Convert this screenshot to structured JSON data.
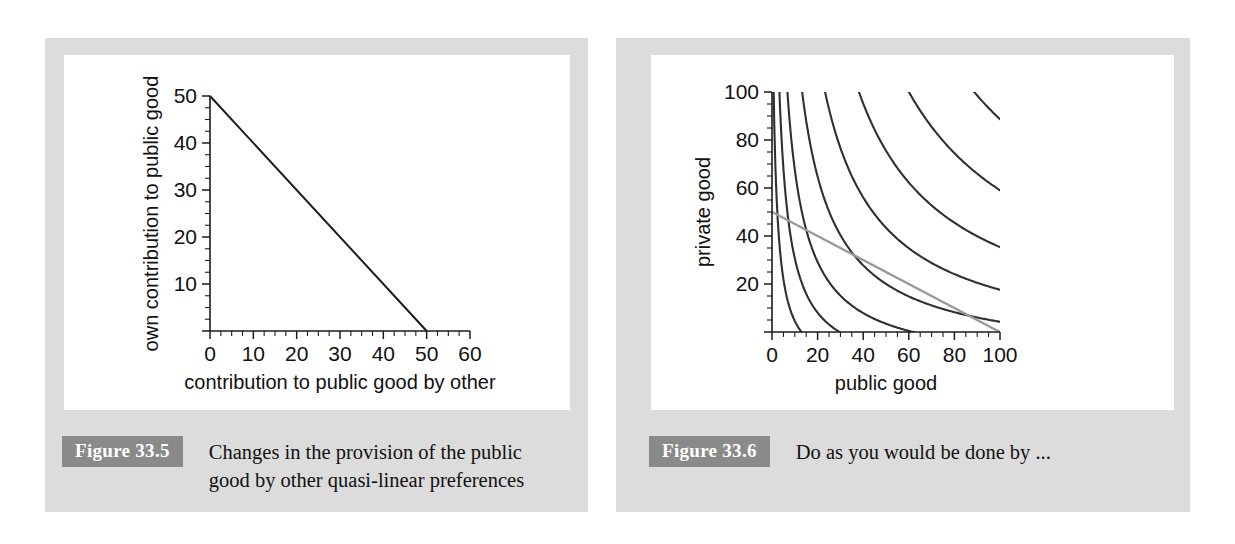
{
  "page": {
    "background_color": "#ffffff",
    "panel_color": "#dcdcdc",
    "plot_background": "#ffffff",
    "badge_color": "#8a8a8a",
    "curve_color": "#2e3035",
    "budget_gray": "#9a9a9a"
  },
  "figures": [
    {
      "badge": "Figure 33.5",
      "caption_line1": "Changes in the provision of the public",
      "caption_line2": "good by other quasi-linear preferences"
    },
    {
      "badge": "Figure 33.6",
      "caption_line1": "Do as you would be done by ...",
      "caption_line2": ""
    }
  ],
  "chart_data": [
    {
      "type": "line",
      "title": "",
      "xlabel": "contribution to public good by other",
      "ylabel": "own contribution to public good",
      "xlim": [
        0,
        60
      ],
      "ylim": [
        0,
        50
      ],
      "xticks": [
        0,
        10,
        20,
        30,
        40,
        50,
        60
      ],
      "xtick_labels": [
        "0",
        "10",
        "20",
        "30",
        "40",
        "50",
        "60"
      ],
      "yticks": [
        0,
        10,
        20,
        30,
        40,
        50
      ],
      "ytick_labels": [
        "",
        "10",
        "20",
        "30",
        "40",
        "50"
      ],
      "minor_tick_step_x": 2.5,
      "minor_tick_step_y": 2.5,
      "grid": false,
      "legend": "none",
      "series": [
        {
          "name": "reaction function",
          "color": "#1c1c1c",
          "x": [
            0,
            50
          ],
          "y": [
            50,
            0
          ]
        }
      ]
    },
    {
      "type": "line",
      "title": "",
      "xlabel": "public good",
      "ylabel": "private good",
      "xlim": [
        0,
        100
      ],
      "ylim": [
        0,
        100
      ],
      "xticks": [
        0,
        20,
        40,
        60,
        80,
        100
      ],
      "xtick_labels": [
        "0",
        "20",
        "40",
        "60",
        "80",
        "100"
      ],
      "yticks": [
        0,
        20,
        40,
        60,
        80,
        100
      ],
      "ytick_labels": [
        "",
        "20",
        "40",
        "60",
        "80",
        "100"
      ],
      "minor_tick_step_x": 5,
      "minor_tick_step_y": 5,
      "grid": false,
      "legend": "none",
      "indifference_curves": [
        {
          "k": 260,
          "ax": 1.5,
          "by": 18
        },
        {
          "k": 560,
          "ax": 1.5,
          "by": 18
        },
        {
          "k": 950,
          "ax": 1.5,
          "by": 15
        },
        {
          "k": 1650,
          "ax": 1.5,
          "by": 12
        },
        {
          "k": 2700,
          "ax": 1.5,
          "by": 9
        },
        {
          "k": 4200,
          "ax": 1.5,
          "by": 6
        },
        {
          "k": 6400,
          "ax": 1.5,
          "by": 4
        },
        {
          "k": 9200,
          "ax": 1.5,
          "by": 2
        },
        {
          "k": 12600,
          "ax": 1.5,
          "by": 1
        }
      ],
      "budget_line": {
        "name": "budget line",
        "color": "#9a9a9a",
        "x": [
          0,
          100
        ],
        "y": [
          50,
          0
        ]
      }
    }
  ]
}
